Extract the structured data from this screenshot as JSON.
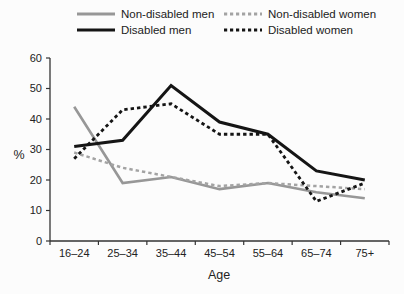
{
  "chart_data": {
    "type": "line",
    "title": "",
    "categories": [
      "16–24",
      "25–34",
      "35–44",
      "45–54",
      "55–64",
      "65–74",
      "75+"
    ],
    "series": [
      {
        "name": "Non-disabled men",
        "color": "#979797",
        "dash": "solid",
        "values": [
          44,
          19,
          21,
          17,
          19,
          16,
          14
        ]
      },
      {
        "name": "Non-disabled women",
        "color": "#a3a3a3",
        "dash": "dashed",
        "values": [
          29,
          24,
          21,
          18,
          19,
          18,
          17
        ]
      },
      {
        "name": "Disabled men",
        "color": "#151515",
        "dash": "solid",
        "values": [
          31,
          33,
          51,
          39,
          35,
          23,
          20
        ]
      },
      {
        "name": "Disabled women",
        "color": "#151515",
        "dash": "dashed",
        "values": [
          27,
          43,
          45,
          35,
          35,
          13,
          19
        ]
      }
    ],
    "xlabel": "Age",
    "ylabel": "%",
    "ylim": [
      0,
      60
    ],
    "yticks": [
      0,
      10,
      20,
      30,
      40,
      50,
      60
    ],
    "legend_position": "top",
    "grid": false,
    "axis_color": "#333333",
    "tick_label_color": "#222222"
  }
}
